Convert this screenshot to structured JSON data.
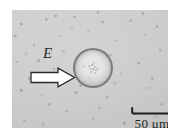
{
  "figure": {
    "kind": "optical-micrograph",
    "caption_elements": {
      "field_label": "E",
      "scale_label": "50 μm"
    },
    "annotations": {
      "field_arrow": {
        "icon": "right-block-arrow-icon",
        "direction": "right",
        "fill_color": "#ffffff",
        "stroke_color": "#2b2b2b"
      },
      "scale_bar": {
        "icon": "scale-bar-bracket-icon",
        "length_value": "50",
        "length_unit": "μm",
        "stroke_color": "#1f1f1f"
      }
    },
    "subject": {
      "name": "droplet",
      "shape": "circle",
      "outline_color": "#6c6c6c",
      "interior_color": "#dcdcdc"
    },
    "background": {
      "base_color": "#c9c9c9",
      "speckle_color": "#7a7a7a"
    }
  }
}
